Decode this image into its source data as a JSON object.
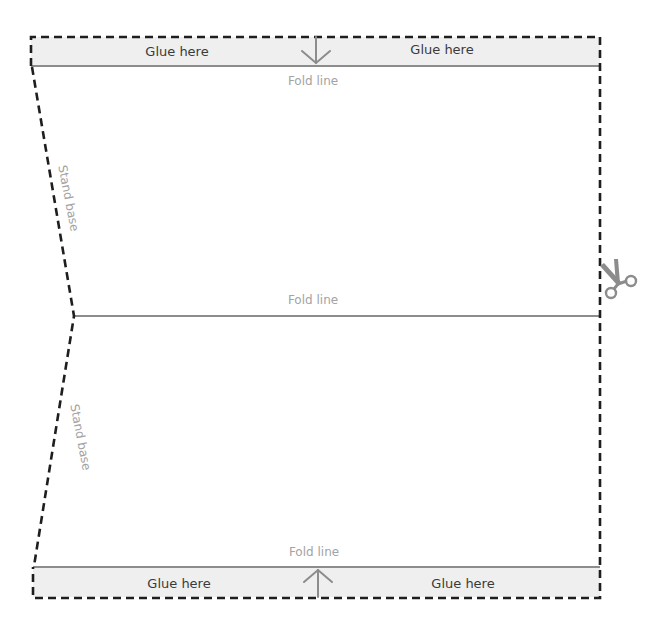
{
  "diagram": {
    "colors": {
      "cut_line": "#1e1e1e",
      "fold_line": "#8c8c8c",
      "glue_fill": "#efefef",
      "glue_text": "#3a3a3a",
      "fold_text": "#a3a3a3",
      "icon": "#8c8c8c"
    },
    "top_glue_tab": {
      "left_label": "Glue here",
      "right_label": "Glue here",
      "arrow": "arrow-down-icon"
    },
    "top_fold": {
      "label": "Fold line"
    },
    "upper_stand_base": {
      "label": "Stand base"
    },
    "middle_fold": {
      "label": "Fold line"
    },
    "lower_stand_base": {
      "label": "Stand base"
    },
    "bottom_fold": {
      "label": "Fold line"
    },
    "bottom_glue_tab": {
      "left_label": "Glue here",
      "right_label": "Glue here",
      "arrow": "arrow-up-icon"
    },
    "cut_marker": {
      "icon": "scissors-icon"
    }
  }
}
